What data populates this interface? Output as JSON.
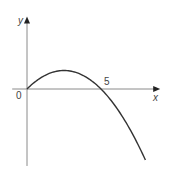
{
  "chart_data": {
    "type": "line",
    "title": "",
    "xlabel": "x",
    "ylabel": "y",
    "origin_label": "0",
    "x_ticks": [
      {
        "value": 5,
        "label": "5"
      }
    ],
    "xlim": [
      -1,
      9
    ],
    "ylim": [
      -5.2,
      4.9
    ],
    "grid": false,
    "legend": "none",
    "series": [
      {
        "name": "curve",
        "equation_form": "y = k x (5 - x)",
        "k": 0.2,
        "x_start": 0,
        "x_end": 8,
        "roots": [
          0,
          5
        ],
        "vertex": {
          "x": 2.5,
          "y": 1.25
        },
        "color": "#333333"
      }
    ],
    "axis_color": "#8a8a8a"
  }
}
